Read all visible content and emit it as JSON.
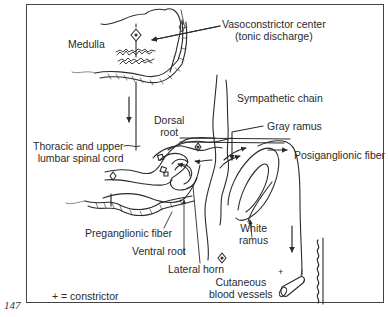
{
  "figure": {
    "page_number": "147",
    "labels": {
      "medulla": "Medulla",
      "vasoconstrictor_center_line1": "Vasoconstrictor center",
      "vasoconstrictor_center_line2": "(tonic discharge)",
      "sympathetic_chain": "Sympathetic chain",
      "gray_ramus": "Gray ramus",
      "dorsal_root_line1": "Dorsal",
      "dorsal_root_line2": "root",
      "spinal_cord_line1": "Thoracic and upper",
      "spinal_cord_line2": "lumbar spinal cord",
      "postganglionic_fiber": "Posiganglionic fiber",
      "preganglionic_fiber": "Preganglionic fiber",
      "ventral_root": "Ventral root",
      "white_ramus_line1": "White",
      "white_ramus_line2": "ramus",
      "lateral_horn": "Lateral horn",
      "cutaneous_line1": "Cutaneous",
      "cutaneous_line2": "blood vessels",
      "vessel_plus": "+"
    },
    "legend": {
      "text": "+  =  constrictor"
    },
    "colors": {
      "line": "#2a2a2a",
      "background": "#ffffff",
      "frame": "#444444"
    }
  }
}
